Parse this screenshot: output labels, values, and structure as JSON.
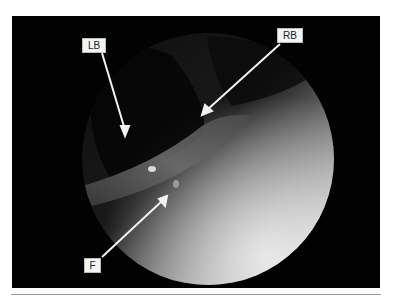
{
  "figure": {
    "type": "endoscopic-image",
    "labels": [
      {
        "id": "LB",
        "text": "LB"
      },
      {
        "id": "RB",
        "text": "RB"
      },
      {
        "id": "F",
        "text": "F"
      }
    ]
  },
  "colors": {
    "frame": "#020202",
    "label_bg": "#f4f4f4",
    "arrow": "#f2f2f2"
  }
}
